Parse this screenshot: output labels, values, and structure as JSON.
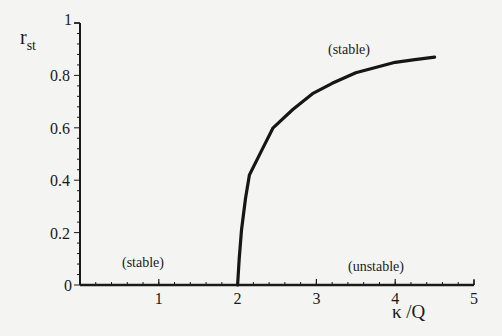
{
  "chart_data": {
    "type": "line",
    "title": "",
    "xlabel": "κ /Q",
    "ylabel": "r_st",
    "ylabel_main": "r",
    "ylabel_sub": "st",
    "xlim": [
      0,
      5
    ],
    "ylim": [
      0,
      1
    ],
    "x_ticks": [
      0,
      1,
      2,
      3,
      4,
      5
    ],
    "x_tick_labels": [
      "1",
      "2",
      "3",
      "4",
      "5"
    ],
    "y_ticks": [
      0,
      0.2,
      0.4,
      0.6,
      0.8,
      1
    ],
    "y_tick_labels": [
      "0",
      "0.2",
      "0.4",
      "0.6",
      "0.8",
      "1"
    ],
    "grid": false,
    "legend": null,
    "series": [
      {
        "name": "stability boundary",
        "x": [
          2.0,
          2.02,
          2.05,
          2.1,
          2.15,
          2.3,
          2.45,
          2.7,
          2.95,
          3.2,
          3.5,
          3.75,
          4.0,
          4.25,
          4.5
        ],
        "y": [
          0.0,
          0.1,
          0.21,
          0.33,
          0.42,
          0.51,
          0.6,
          0.67,
          0.73,
          0.77,
          0.81,
          0.83,
          0.85,
          0.86,
          0.87
        ]
      }
    ],
    "annotations": [
      {
        "text": "(stable)",
        "x": 3.8,
        "y": 0.9,
        "region": "above curve"
      },
      {
        "text": "(stable)",
        "x": 0.9,
        "y": 0.08,
        "region": "left of κ/Q=2"
      },
      {
        "text": "(unstable)",
        "x": 3.9,
        "y": 0.08,
        "region": "below curve"
      }
    ]
  },
  "labels": {
    "ylabel_main": "r",
    "ylabel_sub": "st",
    "xlabel": "κ /Q",
    "stable_top": "(stable)",
    "stable_left": "(stable)",
    "unstable": "(unstable)"
  }
}
